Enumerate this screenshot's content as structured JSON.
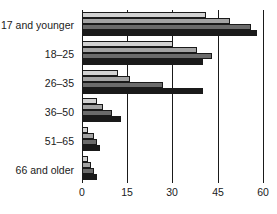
{
  "chart_data": {
    "type": "bar",
    "orientation": "horizontal",
    "title": "",
    "subtitle": "",
    "xlabel": "",
    "ylabel": "",
    "categories": [
      "17 and younger",
      "18–25",
      "26–35",
      "36–50",
      "51–65",
      "66 and older"
    ],
    "series": [
      {
        "name": "series-1",
        "color": "#d2d2d2",
        "values": [
          41,
          30,
          12,
          5,
          2,
          2
        ]
      },
      {
        "name": "series-2",
        "color": "#a3a3a3",
        "values": [
          49,
          38,
          16,
          7,
          4,
          3
        ]
      },
      {
        "name": "series-3",
        "color": "#6b6b6b",
        "values": [
          56,
          43,
          27,
          10,
          5,
          4
        ]
      },
      {
        "name": "series-4",
        "color": "#1a1a1a",
        "values": [
          58,
          40,
          40,
          13,
          6,
          5
        ]
      }
    ],
    "xticks": [
      0,
      15,
      30,
      45,
      60
    ],
    "xtick_labels": [
      "0",
      "15",
      "30",
      "45",
      "60"
    ],
    "xlim": [
      0,
      60
    ],
    "grid": "vertical",
    "legend": "none",
    "annotations": []
  },
  "axis": {
    "tick_labels": [
      "0",
      "15",
      "30",
      "45",
      "60"
    ]
  },
  "categories": {
    "labels": [
      "17 and younger",
      "18–25",
      "26–35",
      "36–50",
      "51–65",
      "66 and older"
    ]
  },
  "colors": {
    "series_1": "#d2d2d2",
    "series_2": "#a3a3a3",
    "series_3": "#6b6b6b",
    "series_4": "#1a1a1a",
    "axis": "#1a1a1a",
    "background": "#ffffff"
  }
}
